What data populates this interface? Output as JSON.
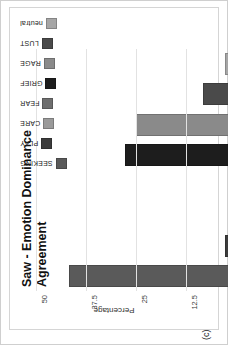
{
  "panel": {
    "label": "(c)"
  },
  "chart_data": {
    "type": "bar",
    "title": "Saw - Emotion Dominance Agreement",
    "title_line1": "Saw - Emotion Dominance",
    "title_line2": "Agreement",
    "xlabel": "",
    "ylabel": "Percentage",
    "categories": [
      "SEEKING",
      "PLAY",
      "CARE",
      "FEAR",
      "GRIEF",
      "RAGE",
      "LUST",
      "neutral"
    ],
    "values": [
      41.7,
      2.8,
      0,
      0,
      27.8,
      25.0,
      8.3,
      2.8
    ],
    "ylim": [
      0,
      50
    ],
    "yticks": [
      0,
      12.5,
      25,
      37.5,
      50
    ],
    "ytick_labels": [
      "0",
      "12.5",
      "25",
      "37.5",
      "50"
    ],
    "grid": true,
    "legend_position": "right",
    "colors": [
      "#5a5a5a",
      "#3c3c3c",
      "#9a9a9a",
      "#6e6e6e",
      "#1d1d1d",
      "#8a8a8a",
      "#4a4a4a",
      "#a6a6a6"
    ],
    "rotation_deg": -90
  }
}
